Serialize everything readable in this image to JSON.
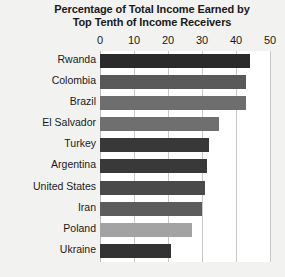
{
  "chart_data": {
    "type": "bar",
    "orientation": "horizontal",
    "title": "Percentage of Total Income Earned by Top Tenth of Income Receivers",
    "title_line1": "Percentage of Total Income Earned by",
    "title_line2": "Top Tenth of Income Receivers",
    "xlabel": "",
    "ylabel": "",
    "xlim": [
      0,
      50
    ],
    "xticks": [
      0,
      10,
      20,
      30,
      40,
      50
    ],
    "xtick_labels": [
      "0",
      "10",
      "20",
      "30",
      "40",
      "50"
    ],
    "grid": true,
    "legend": "none",
    "categories": [
      "Rwanda",
      "Colombia",
      "Brazil",
      "El Salvador",
      "Turkey",
      "Argentina",
      "United States",
      "Iran",
      "Poland",
      "Ukraine"
    ],
    "values": [
      44,
      43,
      43,
      35,
      32,
      31.5,
      31,
      30,
      27,
      21
    ],
    "bar_colors": [
      "#2b2b2b",
      "#595959",
      "#6e6e6e",
      "#6f6f6f",
      "#383838",
      "#393939",
      "#4a4a4a",
      "#5c5c5c",
      "#a3a3a3",
      "#333333"
    ],
    "plot_background": "#ffffff",
    "page_background": "#f2f2f0",
    "gridline_color": "#c8c8c8",
    "text_color": "#1a1a1a"
  }
}
